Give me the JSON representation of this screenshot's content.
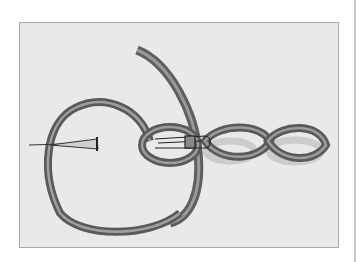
{
  "illustration": {
    "subject": "ribbon chain stitch with needle and safety pin",
    "background_color": "#e9e9e9",
    "ribbon_color": "#6e6e6e",
    "border_color": "#a8a8a8"
  }
}
